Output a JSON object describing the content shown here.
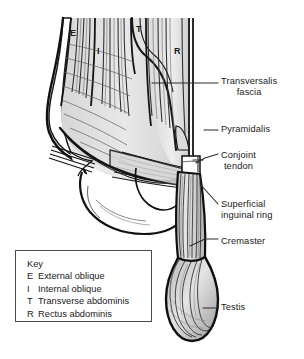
{
  "figure": {
    "type": "anatomical-line-drawing",
    "background_color": "#ffffff",
    "ink_color": "#1a1a1a",
    "shade_light": "#e3e3e3",
    "shade_mid": "#cfcfcf",
    "shade_dark": "#ababab"
  },
  "muscle_markers": [
    {
      "letter": "E",
      "x": 70,
      "y": 28
    },
    {
      "letter": "I",
      "x": 97,
      "y": 46
    },
    {
      "letter": "T",
      "x": 136,
      "y": 24
    },
    {
      "letter": "R",
      "x": 174,
      "y": 46
    }
  ],
  "labels": [
    {
      "name": "transversalis-fascia",
      "lines": [
        "Transversalis",
        "fascia"
      ],
      "x": 221,
      "y": 76,
      "align": "center"
    },
    {
      "name": "pyramidalis",
      "lines": [
        "Pyramidalis"
      ],
      "x": 221,
      "y": 124,
      "align": "left"
    },
    {
      "name": "conjoint-tendon",
      "lines": [
        "Conjoint",
        "tendon"
      ],
      "x": 221,
      "y": 150,
      "align": "center"
    },
    {
      "name": "superficial-inguinal-ring",
      "lines": [
        "Superficial",
        "inguinal ring"
      ],
      "x": 221,
      "y": 199,
      "align": "left"
    },
    {
      "name": "cremaster",
      "lines": [
        "Cremaster"
      ],
      "x": 221,
      "y": 236,
      "align": "left"
    },
    {
      "name": "testis",
      "lines": [
        "Testis"
      ],
      "x": 221,
      "y": 302,
      "align": "left"
    }
  ],
  "key": {
    "title": "Key",
    "entries": [
      {
        "letter": "E",
        "term": "External oblique"
      },
      {
        "letter": "I",
        "term": "Internal oblique"
      },
      {
        "letter": "T",
        "term": "Transverse abdominis"
      },
      {
        "letter": "R",
        "term": "Rectus abdominis"
      }
    ]
  }
}
